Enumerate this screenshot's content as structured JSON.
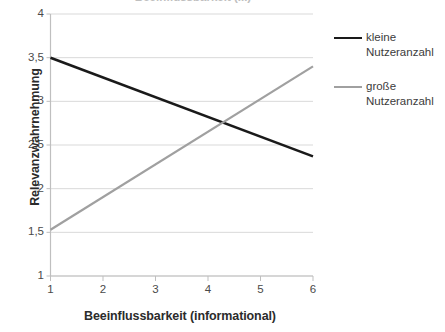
{
  "chart_data": {
    "type": "line",
    "title": "Beeinflussbarkeit (informational)",
    "xlabel": "Beeinflussbarkeit (informational)",
    "ylabel": "Relevanzwahrnehmung",
    "xlim": [
      1,
      6
    ],
    "ylim": [
      1,
      4
    ],
    "x_ticks": [
      "1",
      "2",
      "3",
      "4",
      "5",
      "6"
    ],
    "y_ticks": [
      "1",
      "1,5",
      "2",
      "2,5",
      "3",
      "3,5",
      "4"
    ],
    "x_tick_values": [
      1,
      2,
      3,
      4,
      5,
      6
    ],
    "y_tick_values": [
      1,
      1.5,
      2,
      2.5,
      3,
      3.5,
      4
    ],
    "grid": "horizontal",
    "legend_position": "right",
    "series": [
      {
        "name": "kleine Nutzeranzahl",
        "color": "#1a1a1a",
        "x": [
          1,
          6
        ],
        "values": [
          3.5,
          2.37
        ]
      },
      {
        "name": "große Nutzeranzahl",
        "color": "#a0a0a0",
        "x": [
          1,
          6
        ],
        "values": [
          1.53,
          3.4
        ]
      }
    ],
    "intersection": {
      "x": 4.25,
      "y": 2.75
    }
  },
  "chart": {
    "cut_off_title": "Beeinflussbarkeit (...)",
    "y_axis_title": "Relevanzwahrnehmung",
    "x_axis_title": "Beeinflussbarkeit (informational)",
    "y_tick_labels": [
      "4",
      "3,5",
      "3",
      "2,5",
      "2",
      "1,5",
      "1"
    ],
    "x_tick_labels": [
      "1",
      "2",
      "3",
      "4",
      "5",
      "6"
    ]
  },
  "legend": {
    "items": [
      {
        "label": "kleine\nNutzeranzahl",
        "color": "#1a1a1a",
        "style": "dark"
      },
      {
        "label": "große\nNutzeranzahl",
        "color": "#a0a0a0",
        "style": "gray"
      }
    ]
  },
  "colors": {
    "series_dark": "#1a1a1a",
    "series_gray": "#a0a0a0",
    "gridline": "#d9d9d9",
    "axis": "#bfbfbf",
    "text": "#3a3a3a",
    "background": "#ffffff"
  }
}
